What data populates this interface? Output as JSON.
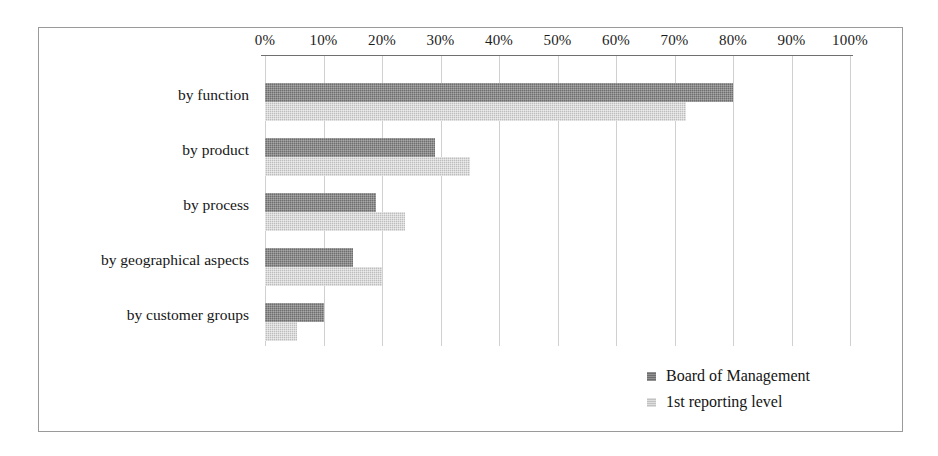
{
  "chart_data": {
    "type": "bar",
    "orientation": "horizontal",
    "title": "",
    "subtitle": "",
    "xlabel": "",
    "ylabel": "",
    "xlim": [
      0,
      100
    ],
    "xtick_labels": [
      "0%",
      "10%",
      "20%",
      "30%",
      "40%",
      "50%",
      "60%",
      "70%",
      "80%",
      "90%",
      "100%"
    ],
    "xtick_values": [
      0,
      10,
      20,
      30,
      40,
      50,
      60,
      70,
      80,
      90,
      100
    ],
    "grid": "vertical",
    "legend_position": "bottom-right",
    "categories": [
      "by function",
      "by product",
      "by process",
      "by geographical aspects",
      "by customer groups"
    ],
    "series": [
      {
        "name": "Board of Management",
        "color": "#6e6e6e",
        "values": [
          80,
          29,
          19,
          15,
          10
        ]
      },
      {
        "name": "1st reporting level",
        "color": "#bdbdbd",
        "values": [
          72,
          35,
          24,
          20,
          5.5
        ]
      }
    ]
  },
  "legend": {
    "items": [
      {
        "label": "Board of Management",
        "swatch": "dark"
      },
      {
        "label": "1st reporting level",
        "swatch": "light"
      }
    ]
  },
  "frame": {
    "border_color": "#9a9a9a",
    "background": "#ffffff"
  }
}
